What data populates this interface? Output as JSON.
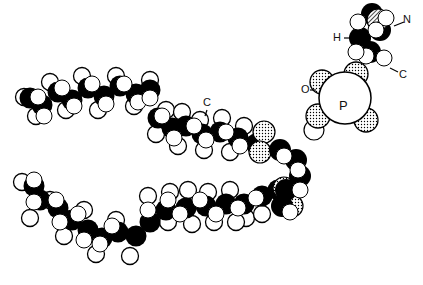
{
  "diagram": {
    "labels": {
      "N": "N",
      "H": "H",
      "C_head": "C",
      "O": "O",
      "P": "P",
      "C_chain": "C"
    },
    "colors": {
      "bond": "#000000",
      "atom_fill": "#ffffff",
      "stipple": "#000000"
    },
    "upper_chain": {
      "black": [
        [
          30,
          98
        ],
        [
          42,
          105
        ],
        [
          58,
          92
        ],
        [
          72,
          100
        ],
        [
          88,
          88
        ],
        [
          104,
          96
        ],
        [
          120,
          86
        ],
        [
          136,
          94
        ],
        [
          150,
          90
        ],
        [
          158,
          118
        ],
        [
          172,
          128
        ],
        [
          186,
          126
        ],
        [
          202,
          134
        ],
        [
          220,
          132
        ],
        [
          238,
          138
        ],
        [
          256,
          144
        ]
      ],
      "hollow_back": [
        [
          24,
          97
        ],
        [
          36,
          116
        ],
        [
          50,
          82
        ],
        [
          66,
          110
        ],
        [
          82,
          76
        ],
        [
          98,
          110
        ],
        [
          116,
          76
        ],
        [
          134,
          106
        ],
        [
          150,
          80
        ],
        [
          166,
          110
        ],
        [
          182,
          112
        ],
        [
          200,
          120
        ],
        [
          222,
          118
        ],
        [
          244,
          126
        ],
        [
          262,
          136
        ],
        [
          156,
          134
        ],
        [
          178,
          146
        ],
        [
          204,
          150
        ],
        [
          230,
          152
        ]
      ],
      "white": [
        [
          38,
          97
        ],
        [
          44,
          116
        ],
        [
          62,
          88
        ],
        [
          74,
          106
        ],
        [
          92,
          84
        ],
        [
          106,
          104
        ],
        [
          124,
          84
        ],
        [
          138,
          102
        ],
        [
          150,
          98
        ],
        [
          162,
          116
        ],
        [
          174,
          138
        ],
        [
          194,
          126
        ],
        [
          206,
          140
        ],
        [
          226,
          132
        ],
        [
          240,
          146
        ]
      ]
    },
    "lower_chain": {
      "black": [
        [
          34,
          186
        ],
        [
          40,
          200
        ],
        [
          58,
          208
        ],
        [
          72,
          220
        ],
        [
          88,
          230
        ],
        [
          102,
          238
        ],
        [
          118,
          232
        ],
        [
          136,
          236
        ],
        [
          150,
          222
        ],
        [
          166,
          210
        ],
        [
          186,
          208
        ],
        [
          206,
          206
        ],
        [
          226,
          204
        ],
        [
          244,
          204
        ],
        [
          262,
          196
        ],
        [
          278,
          190
        ]
      ],
      "hollow_back": [
        [
          22,
          182
        ],
        [
          30,
          218
        ],
        [
          50,
          200
        ],
        [
          64,
          236
        ],
        [
          84,
          210
        ],
        [
          96,
          254
        ],
        [
          116,
          220
        ],
        [
          130,
          256
        ],
        [
          148,
          196
        ],
        [
          170,
          192
        ],
        [
          188,
          190
        ],
        [
          208,
          192
        ],
        [
          230,
          190
        ],
        [
          246,
          218
        ],
        [
          168,
          222
        ],
        [
          192,
          224
        ],
        [
          214,
          222
        ],
        [
          236,
          222
        ],
        [
          262,
          214
        ]
      ],
      "white": [
        [
          34,
          180
        ],
        [
          34,
          202
        ],
        [
          56,
          200
        ],
        [
          60,
          222
        ],
        [
          78,
          214
        ],
        [
          84,
          240
        ],
        [
          100,
          244
        ],
        [
          112,
          226
        ],
        [
          148,
          210
        ],
        [
          168,
          200
        ],
        [
          180,
          214
        ],
        [
          200,
          200
        ],
        [
          216,
          214
        ],
        [
          238,
          208
        ],
        [
          256,
          198
        ]
      ]
    },
    "glycerol": {
      "black": [
        [
          280,
          150
        ],
        [
          296,
          160
        ],
        [
          300,
          176
        ],
        [
          286,
          190
        ],
        [
          282,
          206
        ]
      ],
      "white": [
        [
          284,
          156
        ],
        [
          298,
          170
        ],
        [
          300,
          190
        ],
        [
          290,
          212
        ]
      ],
      "stippled": [
        [
          264,
          132
        ],
        [
          260,
          152
        ],
        [
          284,
          188
        ],
        [
          292,
          206
        ]
      ]
    },
    "phosphate": {
      "P_center": [
        345,
        98
      ],
      "P_radius": 26,
      "stippled": [
        [
          322,
          82
        ],
        [
          366,
          120
        ],
        [
          318,
          116
        ],
        [
          356,
          74
        ]
      ],
      "white": [
        [
          314,
          130
        ]
      ]
    },
    "choline": {
      "black": [
        [
          360,
          38
        ],
        [
          370,
          52
        ],
        [
          380,
          30
        ],
        [
          372,
          14
        ]
      ],
      "white": [
        [
          366,
          56
        ],
        [
          358,
          22
        ],
        [
          386,
          18
        ],
        [
          376,
          30
        ],
        [
          384,
          58
        ],
        [
          356,
          52
        ]
      ],
      "hatched": [
        [
          378,
          20
        ]
      ]
    }
  }
}
